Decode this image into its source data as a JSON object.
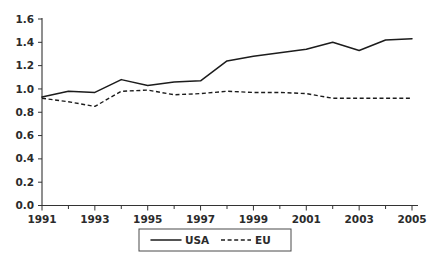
{
  "chart_data": {
    "type": "line",
    "title": "",
    "xlabel": "",
    "ylabel": "",
    "x": [
      1991,
      1992,
      1993,
      1994,
      1995,
      1996,
      1997,
      1998,
      1999,
      2000,
      2001,
      2002,
      2003,
      2004,
      2005
    ],
    "xlim": [
      1991,
      2005
    ],
    "ylim": [
      0.0,
      1.6
    ],
    "grid": false,
    "legend_position": "bottom-center",
    "y_ticks": [
      "0.0",
      "0.2",
      "0.4",
      "0.6",
      "0.8",
      "1.0",
      "1.2",
      "1.4",
      "1.6"
    ],
    "y_tick_values": [
      0.0,
      0.2,
      0.4,
      0.6,
      0.8,
      1.0,
      1.2,
      1.4,
      1.6
    ],
    "x_ticks": [
      "1991",
      "1993",
      "1995",
      "1997",
      "1999",
      "2001",
      "2003",
      "2005"
    ],
    "x_tick_values": [
      1991,
      1993,
      1995,
      1997,
      1999,
      2001,
      2003,
      2005
    ],
    "x_minor_tick_values": [
      1992,
      1994,
      1996,
      1998,
      2000,
      2002,
      2004
    ],
    "series": [
      {
        "name": "USA",
        "style": "solid",
        "color": "#1c1c1c",
        "values": [
          0.93,
          0.98,
          0.97,
          1.08,
          1.03,
          1.06,
          1.07,
          1.24,
          1.28,
          1.31,
          1.34,
          1.4,
          1.33,
          1.42,
          1.43
        ]
      },
      {
        "name": "EU",
        "style": "dashed",
        "color": "#1c1c1c",
        "values": [
          0.92,
          0.89,
          0.85,
          0.98,
          0.99,
          0.95,
          0.96,
          0.98,
          0.97,
          0.97,
          0.96,
          0.92,
          0.92,
          0.92,
          0.92
        ]
      }
    ],
    "legend": [
      {
        "label": "USA",
        "style": "solid"
      },
      {
        "label": "EU",
        "style": "dashed"
      }
    ]
  },
  "axes": {
    "y_axis_name": "value-axis",
    "x_axis_name": "year-axis"
  }
}
